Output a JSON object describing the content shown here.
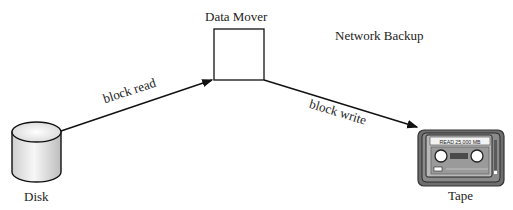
{
  "diagram": {
    "title": "Network Backup",
    "nodes": {
      "data_mover": {
        "label": "Data Mover"
      },
      "disk": {
        "label": "Disk"
      },
      "tape": {
        "label": "Tape",
        "display_text": "READ  25,000 MB"
      }
    },
    "edges": [
      {
        "from": "disk",
        "to": "data_mover",
        "label": "block read"
      },
      {
        "from": "data_mover",
        "to": "tape",
        "label": "block write"
      }
    ]
  }
}
